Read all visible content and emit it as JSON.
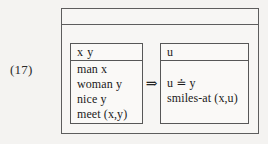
{
  "figure": {
    "example_number": "(17)",
    "outer_drs": {
      "universe": "",
      "connective": "⇒",
      "connective_icon": "double-right-arrow-icon"
    },
    "antecedent": {
      "universe": "x y",
      "conditions": [
        "man x",
        "woman y",
        "nice y",
        "meet (x,y)"
      ]
    },
    "consequent": {
      "universe": "u",
      "conditions": [
        "u ≐ y",
        "smiles-at (x,u)"
      ]
    },
    "colors": {
      "background": "#f4f3f1",
      "box_fill": "#f7f6f4",
      "inner_box_fill": "#faf9f7",
      "border": "#5d5d5d",
      "text": "#1a1a1a"
    }
  }
}
